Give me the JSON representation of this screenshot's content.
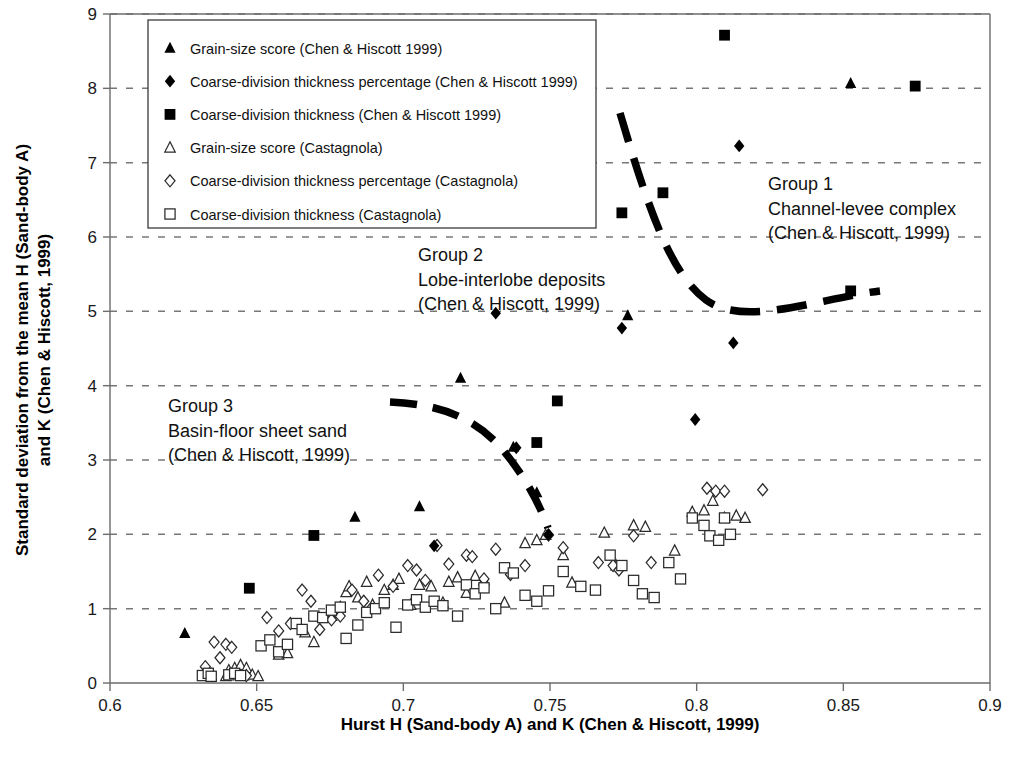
{
  "chart_data": {
    "type": "scatter",
    "title": "",
    "xlabel": "Hurst H (Sand-body A) and K (Chen & Hiscott, 1999)",
    "ylabel": "Standard deviation from the mean H (Sand-body A) and K (Chen & Hiscott, 1999)",
    "xlim": [
      0.6,
      0.9
    ],
    "ylim": [
      0,
      9
    ],
    "xticks": [
      "0.6",
      "0.65",
      "0.7",
      "0.75",
      "0.8",
      "0.85",
      "0.9"
    ],
    "xtick_values": [
      0.6,
      0.65,
      0.7,
      0.75,
      0.8,
      0.85,
      0.9
    ],
    "yticks": [
      "0",
      "1",
      "2",
      "3",
      "4",
      "5",
      "6",
      "7",
      "8",
      "9"
    ],
    "ytick_values": [
      0,
      1,
      2,
      3,
      4,
      5,
      6,
      7,
      8,
      9
    ],
    "grid": "horizontal-dashed",
    "legend_position": "top-left-inside",
    "series": [
      {
        "name": "Grain-size score (Chen & Hiscott 1999)",
        "marker": "filled-triangle",
        "color": "#000000",
        "points": [
          [
            0.6255,
            0.67
          ],
          [
            0.6835,
            2.235
          ],
          [
            0.7055,
            2.375
          ],
          [
            0.7195,
            4.105
          ],
          [
            0.7375,
            3.175
          ],
          [
            0.7455,
            2.565
          ],
          [
            0.7765,
            4.945
          ],
          [
            0.8525,
            8.07
          ]
        ]
      },
      {
        "name": "Coarse-division thickness percentage (Chen & Hiscott 1999)",
        "marker": "filled-diamond",
        "color": "#000000",
        "points": [
          [
            0.7105,
            1.845
          ],
          [
            0.7315,
            4.975
          ],
          [
            0.7385,
            3.165
          ],
          [
            0.7495,
            1.995
          ],
          [
            0.7745,
            4.775
          ],
          [
            0.7995,
            3.545
          ],
          [
            0.8125,
            4.575
          ],
          [
            0.8145,
            7.225
          ]
        ]
      },
      {
        "name": "Coarse-division thickness (Chen & Hiscott 1999)",
        "marker": "filled-square",
        "color": "#000000",
        "points": [
          [
            0.6475,
            1.275
          ],
          [
            0.6695,
            1.985
          ],
          [
            0.7455,
            3.235
          ],
          [
            0.7525,
            3.795
          ],
          [
            0.7745,
            6.325
          ],
          [
            0.7885,
            6.595
          ],
          [
            0.8095,
            8.715
          ],
          [
            0.8525,
            5.275
          ],
          [
            0.8745,
            8.03
          ]
        ]
      },
      {
        "name": "Grain-size score (Castagnola)",
        "marker": "open-triangle",
        "color": "#2b2b2b",
        "points": [
          [
            0.6345,
            0.1
          ],
          [
            0.6395,
            0.09
          ],
          [
            0.6405,
            0.17
          ],
          [
            0.6425,
            0.2
          ],
          [
            0.6435,
            0.12
          ],
          [
            0.6445,
            0.24
          ],
          [
            0.6455,
            0.1
          ],
          [
            0.6465,
            0.2
          ],
          [
            0.6485,
            0.11
          ],
          [
            0.6505,
            0.09
          ],
          [
            0.6575,
            0.38
          ],
          [
            0.6605,
            0.4
          ],
          [
            0.6665,
            0.68
          ],
          [
            0.6695,
            0.55
          ],
          [
            0.6755,
            0.9
          ],
          [
            0.6785,
            1.02
          ],
          [
            0.6805,
            1.22
          ],
          [
            0.6815,
            1.3
          ],
          [
            0.6845,
            1.15
          ],
          [
            0.6875,
            1.36
          ],
          [
            0.6895,
            1.05
          ],
          [
            0.6935,
            1.25
          ],
          [
            0.6965,
            1.32
          ],
          [
            0.6985,
            1.4
          ],
          [
            0.7025,
            1.05
          ],
          [
            0.7055,
            1.32
          ],
          [
            0.7095,
            1.3
          ],
          [
            0.7135,
            1.08
          ],
          [
            0.7155,
            1.36
          ],
          [
            0.7185,
            1.42
          ],
          [
            0.7215,
            1.21
          ],
          [
            0.7245,
            1.44
          ],
          [
            0.7275,
            1.38
          ],
          [
            0.7345,
            1.08
          ],
          [
            0.7415,
            1.88
          ],
          [
            0.7455,
            1.92
          ],
          [
            0.7485,
            1.99
          ],
          [
            0.7545,
            1.72
          ],
          [
            0.7575,
            1.35
          ],
          [
            0.7685,
            2.02
          ],
          [
            0.7725,
            1.58
          ],
          [
            0.7785,
            2.12
          ],
          [
            0.7825,
            2.1
          ],
          [
            0.7925,
            1.78
          ],
          [
            0.7985,
            2.3
          ],
          [
            0.8025,
            2.32
          ],
          [
            0.8055,
            2.45
          ],
          [
            0.8095,
            2.22
          ],
          [
            0.8135,
            2.25
          ],
          [
            0.8165,
            2.22
          ]
        ]
      },
      {
        "name": "Coarse-division thickness percentage  (Castagnola)",
        "marker": "open-diamond",
        "color": "#2b2b2b",
        "points": [
          [
            0.6325,
            0.22
          ],
          [
            0.6345,
            0.12
          ],
          [
            0.6355,
            0.55
          ],
          [
            0.6375,
            0.34
          ],
          [
            0.6395,
            0.52
          ],
          [
            0.6415,
            0.48
          ],
          [
            0.6465,
            0.1
          ],
          [
            0.6535,
            0.88
          ],
          [
            0.6575,
            0.7
          ],
          [
            0.6615,
            0.8
          ],
          [
            0.6655,
            1.25
          ],
          [
            0.6685,
            1.1
          ],
          [
            0.6715,
            0.72
          ],
          [
            0.6755,
            0.85
          ],
          [
            0.6785,
            0.9
          ],
          [
            0.6825,
            1.25
          ],
          [
            0.6865,
            1.1
          ],
          [
            0.6885,
            0.98
          ],
          [
            0.6915,
            1.45
          ],
          [
            0.6965,
            1.3
          ],
          [
            0.7015,
            1.58
          ],
          [
            0.7045,
            1.52
          ],
          [
            0.7075,
            1.38
          ],
          [
            0.7115,
            1.85
          ],
          [
            0.7155,
            1.6
          ],
          [
            0.7215,
            1.72
          ],
          [
            0.7235,
            1.7
          ],
          [
            0.7275,
            1.4
          ],
          [
            0.7315,
            1.8
          ],
          [
            0.7365,
            1.46
          ],
          [
            0.7415,
            1.58
          ],
          [
            0.7495,
            1.99
          ],
          [
            0.7545,
            1.82
          ],
          [
            0.7665,
            1.62
          ],
          [
            0.7715,
            1.58
          ],
          [
            0.7735,
            1.52
          ],
          [
            0.7785,
            1.98
          ],
          [
            0.7845,
            1.62
          ],
          [
            0.8035,
            2.62
          ],
          [
            0.8065,
            2.58
          ],
          [
            0.8095,
            2.58
          ],
          [
            0.8225,
            2.6
          ]
        ]
      },
      {
        "name": "Coarse-division thickness (Castagnola)",
        "marker": "open-square",
        "color": "#2b2b2b",
        "points": [
          [
            0.6315,
            0.1
          ],
          [
            0.6335,
            0.13
          ],
          [
            0.6345,
            0.09
          ],
          [
            0.6405,
            0.11
          ],
          [
            0.6425,
            0.13
          ],
          [
            0.6445,
            0.1
          ],
          [
            0.6515,
            0.5
          ],
          [
            0.6545,
            0.58
          ],
          [
            0.6575,
            0.42
          ],
          [
            0.6605,
            0.52
          ],
          [
            0.6635,
            0.8
          ],
          [
            0.6655,
            0.72
          ],
          [
            0.6695,
            0.9
          ],
          [
            0.6725,
            0.88
          ],
          [
            0.6755,
            0.98
          ],
          [
            0.6785,
            1.02
          ],
          [
            0.6805,
            0.6
          ],
          [
            0.6845,
            0.78
          ],
          [
            0.6875,
            0.95
          ],
          [
            0.6905,
            1.0
          ],
          [
            0.6935,
            1.08
          ],
          [
            0.6975,
            0.75
          ],
          [
            0.7015,
            1.05
          ],
          [
            0.7045,
            1.12
          ],
          [
            0.7075,
            1.02
          ],
          [
            0.7105,
            1.1
          ],
          [
            0.7135,
            1.04
          ],
          [
            0.7185,
            0.9
          ],
          [
            0.7215,
            1.32
          ],
          [
            0.7245,
            1.2
          ],
          [
            0.7275,
            1.28
          ],
          [
            0.7315,
            1.0
          ],
          [
            0.7345,
            1.55
          ],
          [
            0.7375,
            1.48
          ],
          [
            0.7415,
            1.18
          ],
          [
            0.7455,
            1.1
          ],
          [
            0.7495,
            1.24
          ],
          [
            0.7545,
            1.5
          ],
          [
            0.7605,
            1.3
          ],
          [
            0.7655,
            1.25
          ],
          [
            0.7705,
            1.72
          ],
          [
            0.7745,
            1.58
          ],
          [
            0.7785,
            1.38
          ],
          [
            0.7815,
            1.2
          ],
          [
            0.7855,
            1.15
          ],
          [
            0.7905,
            1.62
          ],
          [
            0.7945,
            1.4
          ],
          [
            0.7985,
            2.22
          ],
          [
            0.8025,
            2.12
          ],
          [
            0.8045,
            1.98
          ],
          [
            0.8075,
            1.92
          ],
          [
            0.8095,
            2.22
          ],
          [
            0.8115,
            2.0
          ]
        ]
      }
    ],
    "trend_lines": [
      {
        "name": "group-1-trend",
        "style": "dashed-thick",
        "description": "Decaying curve through Group 1 data"
      },
      {
        "name": "group-3-trend",
        "style": "dashed-thick",
        "description": "Decaying curve through Group 3 data"
      }
    ]
  },
  "legend": {
    "entries": [
      {
        "label": "Grain-size score (Chen & Hiscott 1999)",
        "marker": "filled-triangle"
      },
      {
        "label": "Coarse-division thickness percentage (Chen & Hiscott 1999)",
        "marker": "filled-diamond"
      },
      {
        "label": "Coarse-division thickness (Chen & Hiscott 1999)",
        "marker": "filled-square"
      },
      {
        "label": "Grain-size score (Castagnola)",
        "marker": "open-triangle"
      },
      {
        "label": "Coarse-division thickness percentage  (Castagnola)",
        "marker": "open-diamond"
      },
      {
        "label": "Coarse-division thickness (Castagnola)",
        "marker": "open-square"
      }
    ]
  },
  "annotations": [
    {
      "name": "group-1-annotation",
      "lines": [
        "Group 1",
        "Channel-levee complex",
        "(Chen & Hiscott, 1999)"
      ]
    },
    {
      "name": "group-2-annotation",
      "lines": [
        "Group 2",
        "Lobe-interlobe deposits",
        "(Chen & Hiscott, 1999)"
      ]
    },
    {
      "name": "group-3-annotation",
      "lines": [
        "Group 3",
        "Basin-floor sheet sand",
        "(Chen & Hiscott, 1999)"
      ]
    }
  ],
  "colors": {
    "marker_fill": "#000000",
    "marker_open_stroke": "#2b2b2b",
    "grid": "#777777",
    "axis": "#6b6b6b",
    "text": "#111111"
  }
}
